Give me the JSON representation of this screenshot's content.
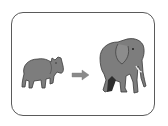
{
  "illustration": {
    "subject": "growth comparison",
    "left_figure": "tapir-icon",
    "connector": "arrow-right-icon",
    "right_figure": "elephant-icon",
    "colors": {
      "frame": "#5a5a5a",
      "animal_fill": "#7d7d7d",
      "animal_dark": "#3a3a3a",
      "arrow": "#8a8a8a",
      "background": "#ffffff"
    }
  }
}
